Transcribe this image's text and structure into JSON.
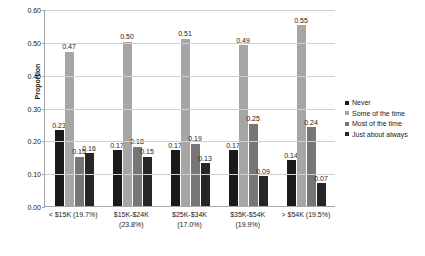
{
  "chart_data": {
    "type": "bar",
    "title": "",
    "xlabel": "",
    "ylabel": "Proportion",
    "ylim": [
      0.0,
      0.6
    ],
    "ytick_labels": [
      "0.00",
      "0.10",
      "0.20",
      "0.30",
      "0.40",
      "0.50",
      "0.60"
    ],
    "ytick_values": [
      0.0,
      0.1,
      0.2,
      0.3,
      0.4,
      0.5,
      0.6
    ],
    "grid": true,
    "legend_position": "right",
    "categories": [
      "< $15K (19.7%)",
      "$15K-$24K (23.8%)",
      "$25K-$34K (17.0%)",
      "$35K-$54K (19.9%)",
      "> $54K (19.5%)"
    ],
    "series": [
      {
        "name": "Never",
        "color": "#1a1a1a",
        "values": [
          0.23,
          0.17,
          0.17,
          0.17,
          0.14
        ],
        "labels": [
          "0.23",
          "0.17",
          "0.17",
          "0.17",
          "0.14"
        ]
      },
      {
        "name": "Some of the time",
        "color": "#a6a6a6",
        "values": [
          0.47,
          0.5,
          0.51,
          0.49,
          0.55
        ],
        "labels": [
          "0.47",
          "0.50",
          "0.51",
          "0.49",
          "0.55"
        ]
      },
      {
        "name": "Most of the time",
        "color": "#767676",
        "values": [
          0.15,
          0.18,
          0.19,
          0.25,
          0.24
        ],
        "labels": [
          "0.15",
          "0.18",
          "0.19",
          "0.25",
          "0.24"
        ]
      },
      {
        "name": "Just about always",
        "color": "#262626",
        "values": [
          0.16,
          0.15,
          0.13,
          0.09,
          0.07
        ],
        "labels": [
          "0.16",
          "0.15",
          "0.13",
          "0.09",
          "0.07"
        ]
      }
    ]
  },
  "axis": {
    "y_title": "Proportion"
  },
  "style": {
    "background": "#ffffff",
    "gridline_color": "#d0d0d0",
    "axis_color": "#a6a6a6",
    "text_color": "#1a1a1a"
  }
}
